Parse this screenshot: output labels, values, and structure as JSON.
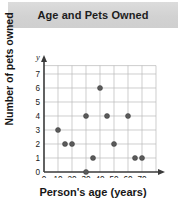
{
  "title": "Age and Pets Owned",
  "axis_titles": {
    "x": "Person's age (years)",
    "y": "Number of pets owned"
  },
  "axis_variables": {
    "x": "x",
    "y": "y"
  },
  "colors": {
    "banner": "#d4d4d4",
    "grid": "#b9b9b9",
    "axis": "#3a3a3a",
    "point": "#5a5a5a",
    "text": "#1b1b1b"
  },
  "chart_data": {
    "type": "scatter",
    "title": "Age and Pets Owned",
    "xlabel": "Person's age (years)",
    "ylabel": "Number of pets owned",
    "xlim": [
      0,
      80
    ],
    "ylim": [
      0,
      7.6
    ],
    "xticks": [
      0,
      10,
      20,
      30,
      40,
      50,
      60,
      70
    ],
    "xtick_labels": [
      "0",
      "10",
      "20",
      "30",
      "40",
      "50",
      "60",
      "70"
    ],
    "yticks": [
      0,
      1,
      2,
      3,
      4,
      5,
      6,
      7
    ],
    "ytick_labels": [
      "0",
      "1",
      "2",
      "3",
      "4",
      "5",
      "6",
      "7"
    ],
    "grid": true,
    "legend": "none",
    "points": [
      {
        "x": 10,
        "y": 3
      },
      {
        "x": 15,
        "y": 2
      },
      {
        "x": 20,
        "y": 2
      },
      {
        "x": 30,
        "y": 0
      },
      {
        "x": 30,
        "y": 4
      },
      {
        "x": 35,
        "y": 1
      },
      {
        "x": 40,
        "y": 6
      },
      {
        "x": 45,
        "y": 4
      },
      {
        "x": 50,
        "y": 2
      },
      {
        "x": 60,
        "y": 4
      },
      {
        "x": 65,
        "y": 1
      },
      {
        "x": 70,
        "y": 1
      }
    ]
  }
}
